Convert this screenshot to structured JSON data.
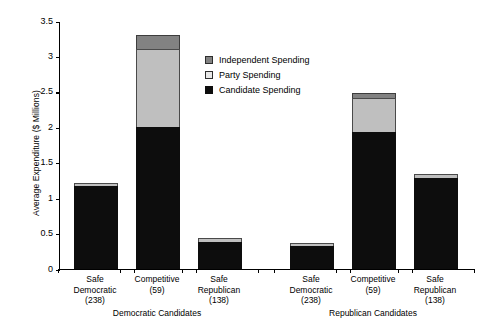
{
  "chart_data": {
    "type": "bar",
    "subtype": "stacked-grouped",
    "title": "",
    "xlabel": "",
    "ylabel": "Average Expenditure ($ Millions)",
    "ylim": [
      0,
      3.5
    ],
    "ytick_labels": [
      "0",
      "0.5",
      "1",
      "1.5",
      "2",
      "2.5",
      "3",
      "3.5"
    ],
    "ytick_values": [
      0,
      0.5,
      1,
      1.5,
      2,
      2.5,
      3,
      3.5
    ],
    "grid": false,
    "legend_position": "inside-upper-center",
    "groups": [
      {
        "name": "Democratic Candidates",
        "categories": [
          {
            "label_line1": "Safe",
            "label_line2": "Democratic",
            "label_line3": "(238)"
          },
          {
            "label_line1": "Competitive",
            "label_line2": "(59)",
            "label_line3": ""
          },
          {
            "label_line1": "Safe",
            "label_line2": "Republican",
            "label_line3": "(138)"
          }
        ]
      },
      {
        "name": "Republican Candidates",
        "categories": [
          {
            "label_line1": "Safe",
            "label_line2": "Democratic",
            "label_line3": "(238)"
          },
          {
            "label_line1": "Competitive",
            "label_line2": "(59)",
            "label_line3": ""
          },
          {
            "label_line1": "Safe",
            "label_line2": "Republican",
            "label_line3": "(138)"
          }
        ]
      }
    ],
    "series": [
      {
        "name": "Candidate Spending",
        "color": "#0d0d0d",
        "values": [
          1.17,
          2.0,
          0.38,
          0.33,
          1.93,
          1.29
        ]
      },
      {
        "name": "Party Spending",
        "color": "#bfbfbf",
        "values": [
          0.05,
          1.11,
          0.06,
          0.04,
          0.49,
          0.05
        ]
      },
      {
        "name": "Independent Spending",
        "color": "#828282",
        "values": [
          0.0,
          0.19,
          0.0,
          0.0,
          0.06,
          0.0
        ]
      }
    ],
    "totals": [
      1.22,
      3.3,
      0.44,
      0.37,
      2.48,
      1.34
    ]
  },
  "legend": {
    "entries": [
      {
        "label": "Independent Spending"
      },
      {
        "label": "Party Spending"
      },
      {
        "label": "Candidate Spending"
      }
    ]
  }
}
